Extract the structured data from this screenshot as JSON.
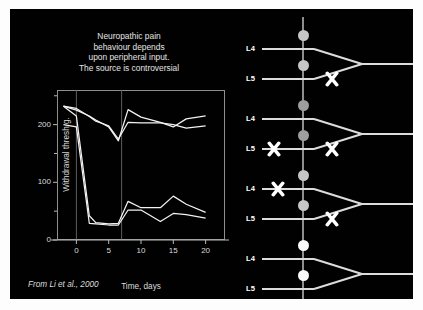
{
  "slide": {
    "background": "#010101",
    "title_lines": [
      "Neuropathic pain",
      "behaviour depends",
      "upon peripheral input.",
      "The source is controversial"
    ],
    "credit": "From Li et al., 2000"
  },
  "chart_data": {
    "type": "line",
    "title": "",
    "xlabel": "Time, days",
    "ylabel": "Withdrawal thresh g.",
    "xlim": [
      -3,
      23
    ],
    "ylim": [
      0,
      260
    ],
    "xticks": [
      0,
      5,
      10,
      15,
      20
    ],
    "yticks": [
      0,
      100,
      200
    ],
    "yminorticks": [
      50,
      150,
      250
    ],
    "grid": false,
    "vlines": [
      0,
      7
    ],
    "legend": "none",
    "x": [
      -2,
      0,
      2,
      3,
      5,
      6.5,
      8,
      10,
      13,
      15,
      17,
      20
    ],
    "series": [
      {
        "name": "intact-high-1",
        "comment": "stays high, dips at day 6.5 then recovers",
        "values": [
          232,
          225,
          215,
          208,
          196,
          172,
          226,
          213,
          204,
          196,
          210,
          215
        ]
      },
      {
        "name": "intact-high-2",
        "comment": "high plateau near 200",
        "values": [
          232,
          228,
          214,
          206,
          198,
          175,
          204,
          203,
          203,
          200,
          194,
          198
        ]
      },
      {
        "name": "lesioned-low-1",
        "comment": "drops to ~30 then partial recovery to ~55-75",
        "values": [
          232,
          215,
          42,
          30,
          28,
          29,
          67,
          56,
          56,
          76,
          62,
          48
        ]
      },
      {
        "name": "lesioned-low-2",
        "comment": "drops to ~27 then recovers to ~38-52",
        "values": [
          200,
          196,
          29,
          28,
          26,
          26,
          52,
          52,
          32,
          46,
          44,
          38
        ]
      }
    ]
  },
  "diagram": {
    "root_labels": {
      "l4": "L4",
      "l5": "L5"
    },
    "panels": [
      {
        "id": "panel-1",
        "soma_color": "#c6c6c6",
        "l4_lesion": false,
        "l5_lesion_proximal": false,
        "l5_lesion_distal": true
      },
      {
        "id": "panel-2",
        "soma_color": "#9e9e9e",
        "l4_lesion": false,
        "l5_lesion_proximal": true,
        "l5_lesion_distal": true
      },
      {
        "id": "panel-3",
        "soma_color": "#c6c6c6",
        "l4_lesion": true,
        "l5_lesion_proximal": false,
        "l5_lesion_distal": true
      },
      {
        "id": "panel-4",
        "soma_color": "#fafafa",
        "l4_lesion": false,
        "l5_lesion_proximal": false,
        "l5_lesion_distal": false
      }
    ]
  }
}
